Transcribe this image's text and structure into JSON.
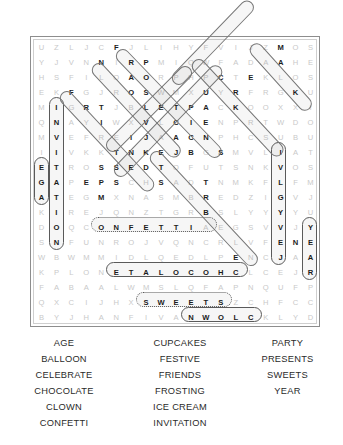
{
  "puzzle": {
    "type": "word-search",
    "rows": 19,
    "cols": 19,
    "grid": [
      [
        "U",
        "Z",
        "L",
        "J",
        "C",
        "F",
        "J",
        "L",
        "I",
        "H",
        "Y",
        "F",
        "V",
        "I",
        "J",
        "Z",
        "M",
        "O",
        "S"
      ],
      [
        "Y",
        "J",
        "V",
        "N",
        "N",
        "I",
        "R",
        "P",
        "M",
        "I",
        "Q",
        "W",
        "F",
        "A",
        "D",
        "A",
        "A",
        "H",
        "E"
      ],
      [
        "H",
        "S",
        "F",
        "I",
        "L",
        "O",
        "A",
        "O",
        "R",
        "P",
        "H",
        "P",
        "C",
        "T",
        "E",
        "K",
        "L",
        "O",
        "S"
      ],
      [
        "E",
        "K",
        "F",
        "G",
        "J",
        "R",
        "O",
        "S",
        "W",
        "M",
        "X",
        "U",
        "Y",
        "R",
        "F",
        "R",
        "G",
        "K",
        "U"
      ],
      [
        "M",
        "I",
        "G",
        "R",
        "T",
        "J",
        "B",
        "L",
        "E",
        "T",
        "P",
        "A",
        "C",
        "K",
        "O",
        "O",
        "X",
        "X",
        "I"
      ],
      [
        "Q",
        "N",
        "A",
        "Y",
        "I",
        "W",
        "X",
        "V",
        "L",
        "C",
        "I",
        "E",
        "N",
        "P",
        "R",
        "T",
        "W",
        "D",
        "O"
      ],
      [
        "M",
        "V",
        "E",
        "F",
        "R",
        "E",
        "I",
        "J",
        "A",
        "A",
        "C",
        "N",
        "P",
        "H",
        "C",
        "S",
        "U",
        "B",
        "U"
      ],
      [
        "I",
        "I",
        "V",
        "K",
        "K",
        "T",
        "N",
        "K",
        "E",
        "J",
        "B",
        "G",
        "S",
        "M",
        "V",
        "L",
        "I",
        "A",
        "T"
      ],
      [
        "E",
        "T",
        "R",
        "O",
        "S",
        "S",
        "E",
        "D",
        "T",
        "O",
        "F",
        "U",
        "T",
        "S",
        "N",
        "K",
        "V",
        "O",
        "S"
      ],
      [
        "G",
        "A",
        "P",
        "E",
        "P",
        "S",
        "C",
        "H",
        "S",
        "A",
        "D",
        "T",
        "N",
        "M",
        "K",
        "F",
        "L",
        "F",
        "M"
      ],
      [
        "A",
        "T",
        "E",
        "G",
        "M",
        "X",
        "N",
        "A",
        "S",
        "M",
        "B",
        "R",
        "E",
        "D",
        "Z",
        "I",
        "G",
        "V",
        "J"
      ],
      [
        "K",
        "I",
        "R",
        "E",
        "J",
        "Q",
        "N",
        "Z",
        "T",
        "G",
        "R",
        "B",
        "S",
        "L",
        "Y",
        "Y",
        "Y",
        "Y",
        "U"
      ],
      [
        "D",
        "O",
        "Q",
        "C",
        "O",
        "N",
        "F",
        "E",
        "T",
        "T",
        "I",
        "A",
        "E",
        "G",
        "S",
        "V",
        "V",
        "J",
        "Y"
      ],
      [
        "S",
        "N",
        "F",
        "U",
        "N",
        "R",
        "O",
        "J",
        "V",
        "Q",
        "N",
        "C",
        "R",
        "L",
        "V",
        "F",
        "E",
        "N",
        "E"
      ],
      [
        "W",
        "B",
        "W",
        "M",
        "M",
        "I",
        "D",
        "L",
        "Q",
        "E",
        "D",
        "L",
        "P",
        "E",
        "N",
        "C",
        "J",
        "A",
        "A"
      ],
      [
        "K",
        "P",
        "L",
        "O",
        "N",
        "E",
        "T",
        "A",
        "L",
        "O",
        "C",
        "O",
        "H",
        "C",
        "L",
        "C",
        "E",
        "J",
        "R"
      ],
      [
        "F",
        "A",
        "B",
        "A",
        "A",
        "L",
        "W",
        "M",
        "S",
        "L",
        "Q",
        "F",
        "A",
        "P",
        "N",
        "Q",
        "U",
        "F",
        "P"
      ],
      [
        "Q",
        "X",
        "C",
        "I",
        "J",
        "H",
        "X",
        "S",
        "W",
        "E",
        "E",
        "T",
        "S",
        "Z",
        "C",
        "H",
        "F",
        "C",
        "C"
      ],
      [
        "B",
        "Y",
        "J",
        "H",
        "A",
        "N",
        "F",
        "I",
        "V",
        "A",
        "N",
        "W",
        "O",
        "L",
        "C",
        "K",
        "L",
        "Y",
        "D"
      ]
    ],
    "found_cells": [
      [
        0,
        5
      ],
      [
        1,
        4
      ],
      [
        1,
        6
      ],
      [
        1,
        7
      ],
      [
        2,
        6
      ],
      [
        2,
        7
      ],
      [
        2,
        12
      ],
      [
        2,
        14
      ],
      [
        0,
        16
      ],
      [
        1,
        16
      ],
      [
        3,
        2
      ],
      [
        3,
        6
      ],
      [
        3,
        7
      ],
      [
        3,
        17
      ],
      [
        3,
        11
      ],
      [
        3,
        13
      ],
      [
        4,
        3
      ],
      [
        4,
        4
      ],
      [
        4,
        7
      ],
      [
        4,
        8
      ],
      [
        4,
        9
      ],
      [
        4,
        10
      ],
      [
        4,
        11
      ],
      [
        4,
        13
      ],
      [
        5,
        4
      ],
      [
        5,
        7
      ],
      [
        5,
        9
      ],
      [
        5,
        10
      ],
      [
        5,
        11
      ],
      [
        6,
        6
      ],
      [
        6,
        7
      ],
      [
        6,
        9
      ],
      [
        6,
        10
      ],
      [
        6,
        11
      ],
      [
        7,
        5
      ],
      [
        7,
        6
      ],
      [
        7,
        7
      ],
      [
        7,
        8
      ],
      [
        7,
        9
      ],
      [
        7,
        10
      ],
      [
        7,
        12
      ],
      [
        7,
        16
      ],
      [
        8,
        4
      ],
      [
        8,
        5
      ],
      [
        8,
        6
      ],
      [
        8,
        7
      ],
      [
        8,
        8
      ],
      [
        8,
        16
      ],
      [
        9,
        3
      ],
      [
        9,
        4
      ],
      [
        9,
        5
      ],
      [
        9,
        8
      ],
      [
        9,
        11
      ],
      [
        9,
        16
      ],
      [
        10,
        4
      ],
      [
        10,
        11
      ],
      [
        10,
        16
      ],
      [
        11,
        11
      ],
      [
        11,
        16
      ],
      [
        12,
        4
      ],
      [
        12,
        5
      ],
      [
        12,
        6
      ],
      [
        12,
        7
      ],
      [
        12,
        8
      ],
      [
        12,
        9
      ],
      [
        12,
        10
      ],
      [
        12,
        16
      ],
      [
        13,
        16
      ],
      [
        13,
        17
      ],
      [
        14,
        13
      ],
      [
        14,
        16
      ],
      [
        15,
        5
      ],
      [
        15,
        6
      ],
      [
        15,
        7
      ],
      [
        15,
        8
      ],
      [
        15,
        9
      ],
      [
        15,
        10
      ],
      [
        15,
        11
      ],
      [
        15,
        12
      ],
      [
        15,
        13
      ],
      [
        17,
        7
      ],
      [
        17,
        8
      ],
      [
        17,
        9
      ],
      [
        17,
        10
      ],
      [
        17,
        11
      ],
      [
        17,
        12
      ],
      [
        18,
        10
      ],
      [
        18,
        11
      ],
      [
        18,
        12
      ],
      [
        18,
        13
      ],
      [
        18,
        14
      ],
      [
        8,
        0
      ],
      [
        9,
        0
      ],
      [
        10,
        0
      ],
      [
        4,
        1
      ],
      [
        5,
        1
      ],
      [
        6,
        1
      ],
      [
        7,
        1
      ],
      [
        8,
        1
      ],
      [
        9,
        1
      ],
      [
        10,
        1
      ],
      [
        11,
        1
      ],
      [
        12,
        1
      ],
      [
        13,
        1
      ],
      [
        12,
        18
      ],
      [
        13,
        18
      ],
      [
        14,
        18
      ],
      [
        15,
        18
      ]
    ],
    "solution_words": [
      {
        "word": "CONFETTI",
        "display": "CONFETTI",
        "direction": "horizontal",
        "row": 12
      },
      {
        "word": "CHOCOLATE",
        "display": "ETALOCOHC",
        "direction": "horizontal-reversed",
        "row": 15
      },
      {
        "word": "SWEETS",
        "display": "SWEETS",
        "direction": "horizontal",
        "row": 17
      },
      {
        "word": "CLOWN",
        "display": "NWOLC",
        "direction": "horizontal-reversed",
        "row": 18
      },
      {
        "word": "AGE",
        "display": "EGA",
        "direction": "vertical-reversed",
        "col": 0
      },
      {
        "word": "INVITATION",
        "display": "INVITATION",
        "direction": "vertical",
        "col": 1
      },
      {
        "word": "PRESENTS",
        "display": "STNESERP",
        "direction": "vertical-reversed",
        "col": 16
      },
      {
        "word": "YEAR",
        "display": "YEAR",
        "direction": "vertical",
        "col": 18
      },
      {
        "word": "BALLOON",
        "direction": "diagonal"
      },
      {
        "word": "CELEBRATE",
        "direction": "diagonal"
      },
      {
        "word": "CUPCAKES",
        "direction": "diagonal"
      },
      {
        "word": "FESTIVE",
        "direction": "diagonal"
      },
      {
        "word": "FRIENDS",
        "direction": "diagonal"
      },
      {
        "word": "FROSTING",
        "direction": "diagonal"
      },
      {
        "word": "ICE CREAM",
        "direction": "diagonal"
      },
      {
        "word": "PARTY",
        "direction": "diagonal"
      }
    ]
  },
  "wordlist": {
    "column1": [
      "AGE",
      "BALLOON",
      "CELEBRATE",
      "CHOCOLATE",
      "CLOWN",
      "CONFETTI"
    ],
    "column2": [
      "CUPCAKES",
      "FESTIVE",
      "FRIENDS",
      "FROSTING",
      "ICE CREAM",
      "INVITATION"
    ],
    "column3": [
      "PARTY",
      "PRESENTS",
      "SWEETS",
      "YEAR"
    ]
  },
  "colors": {
    "grid_letter": "#c9c9c9",
    "found_letter": "#1d1d1d",
    "frame_border": "#8d8d8d",
    "highlight_stroke": "#5a5a5a",
    "wordlist_text": "#2a2a2a",
    "background": "#ffffff"
  }
}
